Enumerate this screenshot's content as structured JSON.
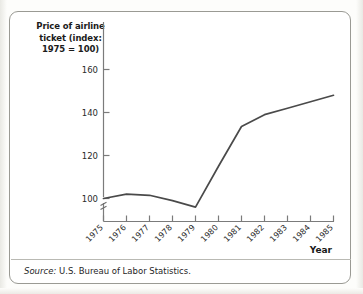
{
  "figure": {
    "title": "Price of airline ticket (index: 1975 = 100)",
    "title_line1": "Price of airline",
    "title_line2": "ticket (index:",
    "title_line3": "1975 = 100)",
    "x_axis_title": "Year",
    "source_prefix": "Source:",
    "source_text": "U.S. Bureau of Labor Statistics.",
    "axis_break_marker": "axis-break"
  },
  "colors": {
    "line": "#4a4a4a",
    "axis": "#7b7b7b",
    "frame": "#9a9a94",
    "text": "#1b1b1b",
    "background": "#ffffff",
    "page": "#fdfdfb"
  },
  "chart_data": {
    "type": "line",
    "title": "Price of airline ticket (index: 1975 = 100)",
    "xlabel": "Year",
    "ylabel": "Price of airline ticket (index: 1975 = 100)",
    "x": [
      1975,
      1976,
      1977,
      1978,
      1979,
      1980,
      1981,
      1982,
      1983,
      1984,
      1985
    ],
    "categories": [
      "1975",
      "1976",
      "1977",
      "1978",
      "1979",
      "1980",
      "1981",
      "1982",
      "1983",
      "1984",
      "1985"
    ],
    "values": [
      100,
      102,
      101.5,
      99,
      96,
      115,
      133.5,
      139,
      142,
      145,
      148
    ],
    "series": [
      {
        "name": "Price of airline ticket (index: 1975 = 100)",
        "values": [
          100,
          102,
          101.5,
          99,
          96,
          115,
          133.5,
          139,
          142,
          145,
          148
        ]
      }
    ],
    "ytick_labels": [
      "100",
      "120",
      "140",
      "160"
    ],
    "ytick_values": [
      100,
      120,
      140,
      160
    ],
    "ylim": [
      88,
      168
    ],
    "xlim": [
      1975,
      1985
    ],
    "grid": false,
    "legend": false,
    "y_axis_broken": true,
    "annotations": [
      "Source: U.S. Bureau of Labor Statistics."
    ]
  }
}
